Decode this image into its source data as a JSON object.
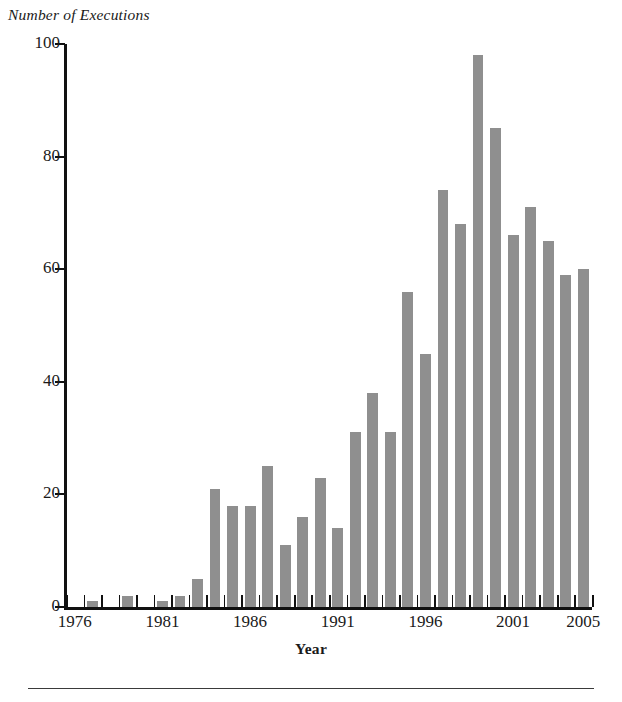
{
  "chart_data": {
    "type": "bar",
    "title": "",
    "ylabel": "Number of Executions",
    "xlabel": "Year",
    "ylim": [
      0,
      100
    ],
    "yticks": [
      0,
      20,
      40,
      60,
      80,
      100
    ],
    "xticklabels": [
      "1976",
      "1981",
      "1986",
      "1991",
      "1996",
      "2001",
      "2005"
    ],
    "grid": false,
    "legend": null,
    "bar_color": "#8f8f8f",
    "axis_color": "#111111",
    "background": "#ffffff",
    "categories": [
      "1976",
      "1977",
      "1978",
      "1979",
      "1980",
      "1981",
      "1982",
      "1983",
      "1984",
      "1985",
      "1986",
      "1987",
      "1988",
      "1989",
      "1990",
      "1991",
      "1992",
      "1993",
      "1994",
      "1995",
      "1996",
      "1997",
      "1998",
      "1999",
      "2000",
      "2001",
      "2002",
      "2003",
      "2004",
      "2005"
    ],
    "values": [
      0,
      1,
      0,
      2,
      0,
      1,
      2,
      5,
      21,
      18,
      18,
      25,
      11,
      16,
      23,
      14,
      31,
      38,
      31,
      56,
      45,
      74,
      68,
      98,
      85,
      66,
      71,
      65,
      59,
      60
    ]
  },
  "footer": {
    "rule": ""
  }
}
